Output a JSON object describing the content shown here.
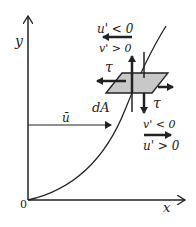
{
  "diagram": {
    "axes": {
      "y_label": "y",
      "x_label": "x",
      "origin_label": "0"
    },
    "mean_velocity_label": "ū",
    "element": {
      "area_label": "dA",
      "shear_top_label": "τ",
      "shear_bottom_label": "τ",
      "fill_color": "#c8c8c8"
    },
    "top_annotation": {
      "line1": "u' < 0",
      "line2": "v' > 0"
    },
    "bottom_annotation": {
      "line1": "v' < 0",
      "line2": "u' > 0"
    }
  }
}
